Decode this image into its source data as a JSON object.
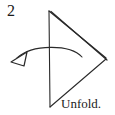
{
  "figure": {
    "step_number": "2",
    "caption": "Unfold.",
    "colors": {
      "ink": "#1b1b1b",
      "line": "#2a2a2a",
      "background": "#ffffff",
      "arrow_fill": "#ffffff"
    },
    "shape": {
      "name": "folded-triangle",
      "description": "right-pointing triangle with doubled upper edge indicating a folded paper layer",
      "vertices": {
        "top": [
          49,
          11
        ],
        "bottom": [
          50,
          107
        ],
        "right": [
          106,
          59
        ]
      },
      "spine_label": "vertical fold line",
      "upper_edge_label": "doubled folded edge",
      "lower_edge_label": "single open edge"
    },
    "arrow": {
      "name": "unfold-arrow",
      "style": "hollow-open-arrowhead",
      "direction": "right-to-left",
      "tail": [
        82,
        57
      ],
      "tip": [
        11,
        62
      ],
      "apex": [
        48,
        47
      ]
    }
  }
}
